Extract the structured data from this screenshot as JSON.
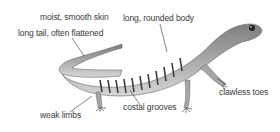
{
  "diagram": {
    "labels": {
      "skin": "moist, smooth skin",
      "body": "long, rounded body",
      "tail": "long tail, often flattened",
      "grooves": "costal grooves",
      "toes": "clawless toes",
      "limbs": "weak limbs"
    },
    "colors": {
      "body_dark": "#4a4a4a",
      "body_mid": "#8a8a8a",
      "body_light": "#c8c8c8",
      "label_text": "#3a3a3a",
      "leader_line": "#333333"
    }
  }
}
